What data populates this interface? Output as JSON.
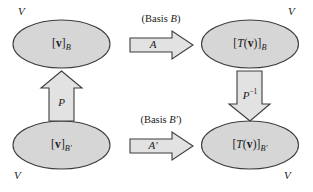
{
  "figure": {
    "background_color": "#ffffff",
    "shape_fill": "#d6d6d6",
    "arrow_fill": "#e2e2e2",
    "stroke_color": "#3d3d3d",
    "text_color": "#1a1a1a"
  },
  "spaces": [
    {
      "id": "top-left",
      "corner_label": "V",
      "content_prefix": "[",
      "content_vector": "v",
      "content_suffix": "]",
      "content_subscript": "B"
    },
    {
      "id": "top-right",
      "corner_label": "V",
      "content_prefix": "[",
      "content_operator": "T",
      "content_open": "(",
      "content_vector": "v",
      "content_close": ")",
      "content_suffix": "]",
      "content_subscript": "B"
    },
    {
      "id": "bottom-left",
      "corner_label": "V",
      "content_prefix": "[",
      "content_vector": "v",
      "content_suffix": "]",
      "content_subscript": "B′"
    },
    {
      "id": "bottom-right",
      "corner_label": "V",
      "content_prefix": "[",
      "content_operator": "T",
      "content_open": "(",
      "content_vector": "v",
      "content_close": ")",
      "content_suffix": "]",
      "content_subscript": "B′"
    }
  ],
  "arrows": {
    "top": {
      "caption_open": "(Basis ",
      "caption_basis": "B",
      "caption_close": ")",
      "matrix_label": "A",
      "direction": "right"
    },
    "bottom": {
      "caption_open": "(Basis ",
      "caption_basis": "B′",
      "caption_close": ")",
      "matrix_label": "A′",
      "direction": "right"
    },
    "left": {
      "matrix_label": "P",
      "direction": "up"
    },
    "right": {
      "matrix_label": "P",
      "matrix_exponent": "−1",
      "direction": "down"
    }
  }
}
